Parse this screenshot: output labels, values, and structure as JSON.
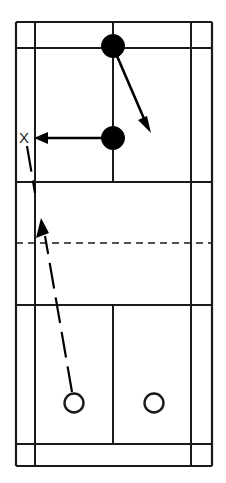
{
  "figure": {
    "type": "badminton-court-diagram",
    "orientation": "vertical",
    "background_color": "#ffffff",
    "line_color": "#1a1a1a",
    "width_px": 226,
    "height_px": 483
  },
  "labels": {
    "target_marker": "X"
  },
  "court": {
    "outer_boundary": {
      "x1": 16,
      "y1": 22,
      "x2": 212,
      "y2": 466
    },
    "vertical_lines": [
      {
        "name": "left-outer-sideline",
        "x": 16,
        "y1": 22,
        "y2": 466
      },
      {
        "name": "left-inner-sideline",
        "x": 35,
        "y1": 22,
        "y2": 466
      },
      {
        "name": "right-inner-sideline",
        "x": 191,
        "y1": 22,
        "y2": 466
      },
      {
        "name": "right-outer-sideline",
        "x": 212,
        "y1": 22,
        "y2": 466
      },
      {
        "name": "far-centre-line",
        "x": 113,
        "y1": 22,
        "y2": 182
      },
      {
        "name": "near-centre-line",
        "x": 113,
        "y1": 305,
        "y2": 444
      }
    ],
    "horizontal_lines": [
      {
        "name": "far-back-boundary",
        "y": 22,
        "x1": 16,
        "x2": 212
      },
      {
        "name": "far-long-service-line-doubles",
        "y": 48,
        "x1": 16,
        "x2": 212
      },
      {
        "name": "far-short-service-line",
        "y": 182,
        "x1": 16,
        "x2": 212
      },
      {
        "name": "near-short-service-line",
        "y": 305,
        "x1": 16,
        "x2": 212
      },
      {
        "name": "near-long-service-line-doubles",
        "y": 444,
        "x1": 16,
        "x2": 212
      },
      {
        "name": "near-back-boundary",
        "y": 466,
        "x1": 16,
        "x2": 212
      }
    ],
    "net": {
      "name": "net",
      "y": 243,
      "x1": 16,
      "x2": 212,
      "style": "dashed"
    }
  },
  "markers": [
    {
      "name": "opponent-rear",
      "style": "filled",
      "cx": 113,
      "cy": 46,
      "r": 11.5
    },
    {
      "name": "opponent-front",
      "style": "filled",
      "cx": 113,
      "cy": 138,
      "r": 11.5
    },
    {
      "name": "player-left",
      "style": "open",
      "cx": 74,
      "cy": 403,
      "r": 9.5
    },
    {
      "name": "player-right",
      "style": "open",
      "cx": 154,
      "cy": 403,
      "r": 9.5
    }
  ],
  "target": {
    "name": "target-x",
    "x": 25,
    "y": 137
  },
  "arrows": [
    {
      "name": "shot-arrow-diagonal",
      "style": "solid",
      "from": {
        "x": 117,
        "y": 56
      },
      "to": {
        "x": 150,
        "y": 130
      }
    },
    {
      "name": "shot-arrow-to-target",
      "style": "solid",
      "from": {
        "x": 102,
        "y": 138
      },
      "to": {
        "x": 36,
        "y": 138
      }
    },
    {
      "name": "player-movement-path",
      "style": "dashed",
      "from": {
        "x": 72,
        "y": 392
      },
      "to": {
        "x": 41,
        "y": 220
      }
    },
    {
      "name": "target-continuation-path",
      "style": "dashed",
      "from": {
        "x": 27,
        "y": 146
      },
      "to": {
        "x": 35,
        "y": 193
      }
    }
  ]
}
